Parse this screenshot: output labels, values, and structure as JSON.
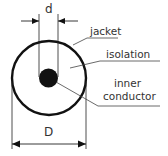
{
  "diagram": {
    "dimensions": {
      "inner_diameter_label": "d",
      "outer_diameter_label": "D"
    },
    "labels": {
      "jacket": "jacket",
      "isolation": "isolation",
      "inner_line1": "inner",
      "inner_line2": "conductor"
    },
    "colors": {
      "stroke": "#111111",
      "leader": "#444444",
      "text": "#333333",
      "background": "#ffffff"
    }
  }
}
